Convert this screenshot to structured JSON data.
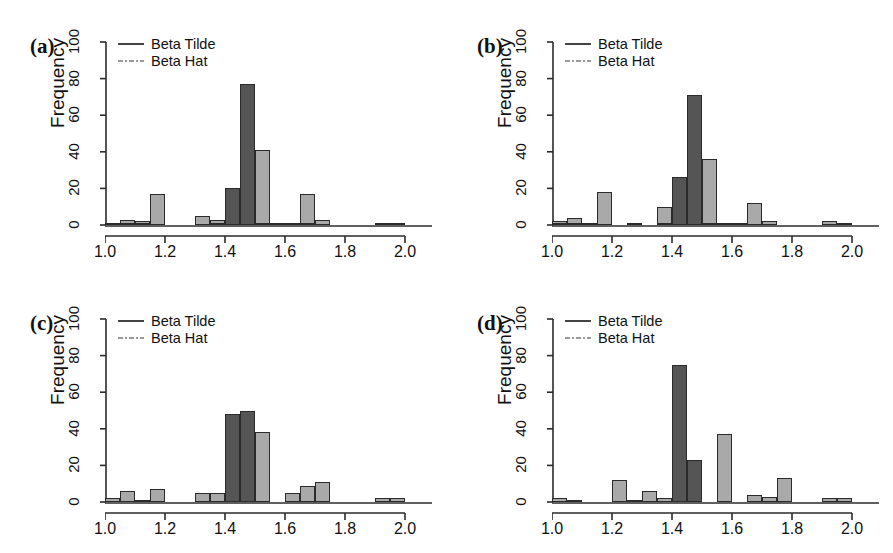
{
  "figure": {
    "panel_count": 4,
    "axis_color": "#2b2b2b",
    "tilde_color": "#555555",
    "hat_color": "#a9a9a9"
  },
  "legend": {
    "tilde_label": "Beta Tilde",
    "hat_label": "Beta Hat",
    "tilde_key": "solid-line-icon",
    "hat_key": "dash-dot-line-icon"
  },
  "axes": {
    "ylabel": "Frequency",
    "yticks": [
      0,
      20,
      40,
      60,
      80,
      100
    ],
    "ylim": [
      0,
      100
    ],
    "xticks": [
      "1.0",
      "1.2",
      "1.4",
      "1.6",
      "1.8",
      "2.0"
    ],
    "xtick_values": [
      1.0,
      1.2,
      1.4,
      1.6,
      1.8,
      2.0
    ],
    "xlim": [
      1.0,
      2.05
    ],
    "xlabel": ""
  },
  "panels": [
    {
      "tag": "(a)",
      "id": "panel-a"
    },
    {
      "tag": "(b)",
      "id": "panel-b"
    },
    {
      "tag": "(c)",
      "id": "panel-c"
    },
    {
      "tag": "(d)",
      "id": "panel-d"
    }
  ],
  "chart_data": [
    {
      "type": "bar",
      "panel": "(a)",
      "title": "",
      "xlabel": "",
      "ylabel": "Frequency",
      "xlim": [
        1.0,
        2.05
      ],
      "ylim": [
        0,
        100
      ],
      "grid": false,
      "legend_position": "top-left",
      "bin_width": 0.05,
      "series": [
        {
          "name": "Beta Tilde",
          "color": "#555555",
          "bins": [
            1.05,
            1.1,
            1.15,
            1.2,
            1.25,
            1.3,
            1.35,
            1.4,
            1.45,
            1.5,
            1.55,
            1.6,
            1.65,
            1.7,
            1.75,
            1.8,
            1.85,
            1.9,
            1.95,
            2.0
          ],
          "values": [
            1,
            1,
            1,
            0,
            0,
            0,
            0,
            1,
            20,
            77,
            1,
            0,
            1,
            1,
            0,
            0,
            0,
            0,
            0,
            1
          ]
        },
        {
          "name": "Beta Hat",
          "color": "#a9a9a9",
          "bins": [
            1.05,
            1.1,
            1.15,
            1.2,
            1.25,
            1.3,
            1.35,
            1.4,
            1.45,
            1.5,
            1.55,
            1.6,
            1.65,
            1.7,
            1.75,
            1.8,
            1.85,
            1.9,
            1.95,
            2.0
          ],
          "values": [
            1,
            3,
            2,
            17,
            0,
            0,
            5,
            3,
            0,
            0,
            41,
            1,
            1,
            17,
            3,
            0,
            0,
            0,
            1,
            0
          ]
        }
      ]
    },
    {
      "type": "bar",
      "panel": "(b)",
      "title": "",
      "xlabel": "",
      "ylabel": "Frequency",
      "xlim": [
        1.0,
        2.05
      ],
      "ylim": [
        0,
        100
      ],
      "grid": false,
      "legend_position": "top-left",
      "bin_width": 0.05,
      "series": [
        {
          "name": "Beta Tilde",
          "color": "#555555",
          "bins": [
            1.05,
            1.1,
            1.15,
            1.2,
            1.25,
            1.3,
            1.35,
            1.4,
            1.45,
            1.5,
            1.55,
            1.6,
            1.65,
            1.7,
            1.75,
            1.8,
            1.85,
            1.9,
            1.95,
            2.0
          ],
          "values": [
            1,
            1,
            0,
            0,
            0,
            0,
            0,
            1,
            26,
            71,
            1,
            1,
            0,
            0,
            0,
            0,
            0,
            0,
            0,
            1
          ]
        },
        {
          "name": "Beta Hat",
          "color": "#a9a9a9",
          "bins": [
            1.05,
            1.1,
            1.15,
            1.2,
            1.25,
            1.3,
            1.35,
            1.4,
            1.45,
            1.5,
            1.55,
            1.6,
            1.65,
            1.7,
            1.75,
            1.8,
            1.85,
            1.9,
            1.95,
            2.0
          ],
          "values": [
            2,
            4,
            1,
            18,
            0,
            1,
            0,
            10,
            5,
            0,
            36,
            1,
            1,
            12,
            2,
            0,
            0,
            0,
            2,
            0
          ]
        }
      ]
    },
    {
      "type": "bar",
      "panel": "(c)",
      "title": "",
      "xlabel": "",
      "ylabel": "Frequency",
      "xlim": [
        1.0,
        2.05
      ],
      "ylim": [
        0,
        100
      ],
      "grid": false,
      "legend_position": "top-left",
      "bin_width": 0.05,
      "series": [
        {
          "name": "Beta Tilde",
          "color": "#555555",
          "bins": [
            1.05,
            1.1,
            1.15,
            1.2,
            1.25,
            1.3,
            1.35,
            1.4,
            1.45,
            1.5,
            1.55,
            1.6,
            1.65,
            1.7,
            1.75,
            1.8,
            1.85,
            1.9,
            1.95,
            2.0
          ],
          "values": [
            0,
            0,
            0,
            0,
            0,
            0,
            0,
            0,
            48,
            50,
            0,
            0,
            0,
            0,
            0,
            0,
            0,
            0,
            0,
            0
          ]
        },
        {
          "name": "Beta Hat",
          "color": "#a9a9a9",
          "bins": [
            1.05,
            1.1,
            1.15,
            1.2,
            1.25,
            1.3,
            1.35,
            1.4,
            1.45,
            1.5,
            1.55,
            1.6,
            1.65,
            1.7,
            1.75,
            1.8,
            1.85,
            1.9,
            1.95,
            2.0
          ],
          "values": [
            2,
            6,
            1,
            7,
            0,
            0,
            5,
            5,
            3,
            0,
            38,
            0,
            5,
            9,
            11,
            0,
            0,
            0,
            2,
            2
          ]
        }
      ]
    },
    {
      "type": "bar",
      "panel": "(d)",
      "title": "",
      "xlabel": "",
      "ylabel": "Frequency",
      "xlim": [
        1.0,
        2.05
      ],
      "ylim": [
        0,
        100
      ],
      "grid": false,
      "legend_position": "top-left",
      "bin_width": 0.05,
      "series": [
        {
          "name": "Beta Tilde",
          "color": "#555555",
          "bins": [
            1.05,
            1.1,
            1.15,
            1.2,
            1.25,
            1.3,
            1.35,
            1.4,
            1.45,
            1.5,
            1.55,
            1.6,
            1.65,
            1.7,
            1.75,
            1.8,
            1.85,
            1.9,
            1.95,
            2.0
          ],
          "values": [
            0,
            0,
            0,
            0,
            0,
            0,
            0,
            0,
            75,
            23,
            0,
            0,
            0,
            0,
            0,
            0,
            0,
            0,
            0,
            0
          ]
        },
        {
          "name": "Beta Hat",
          "color": "#a9a9a9",
          "bins": [
            1.05,
            1.1,
            1.15,
            1.2,
            1.25,
            1.3,
            1.35,
            1.4,
            1.45,
            1.5,
            1.55,
            1.6,
            1.65,
            1.7,
            1.75,
            1.8,
            1.85,
            1.9,
            1.95,
            2.0
          ],
          "values": [
            2,
            1,
            0,
            0,
            12,
            1,
            6,
            2,
            8,
            0,
            0,
            37,
            0,
            4,
            3,
            13,
            0,
            0,
            2,
            2
          ]
        }
      ]
    }
  ]
}
